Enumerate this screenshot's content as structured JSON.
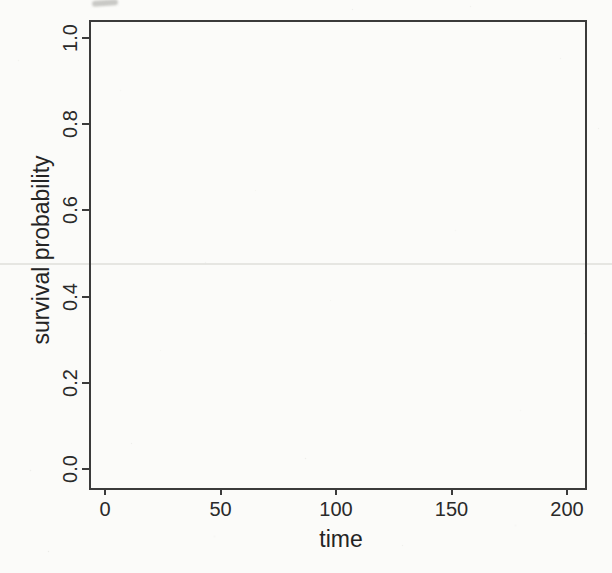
{
  "chart_data": {
    "type": "line",
    "title": "",
    "xlabel": "time",
    "ylabel": "survival probability",
    "xlim": [
      -9,
      209
    ],
    "ylim": [
      -0.04,
      1.04
    ],
    "x_ticks": [
      0,
      50,
      100,
      150,
      200
    ],
    "x_tick_labels": [
      "0",
      "50",
      "100",
      "150",
      "200"
    ],
    "y_ticks": [
      0.0,
      0.2,
      0.4,
      0.6,
      0.8,
      1.0
    ],
    "y_tick_labels": [
      "0.0",
      "0.2",
      "0.4",
      "0.6",
      "0.8",
      "1.0"
    ],
    "series": [],
    "grid": false,
    "legend": null,
    "box": "full-frame",
    "colors": {
      "axis": "#3b3b3b",
      "text": "#272727",
      "paper": "#fbfbf9"
    }
  }
}
